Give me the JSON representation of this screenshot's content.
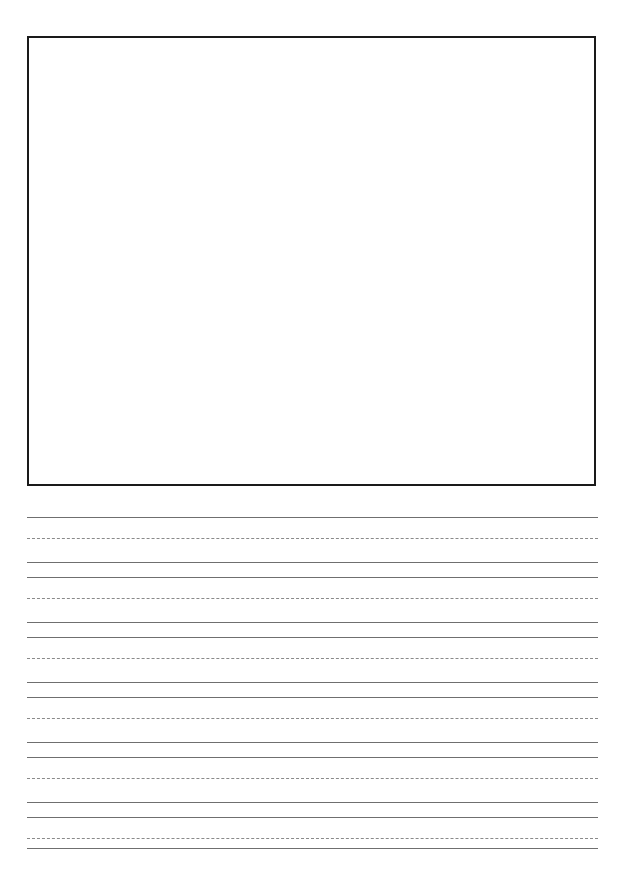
{
  "page": {
    "kind": "handwriting-practice-worksheet",
    "width": 627,
    "height": 876,
    "background_color": "#ffffff",
    "title": "",
    "name_label": "",
    "date_label": ""
  },
  "drawing_box": {
    "name": "illustration-box",
    "label": "",
    "content": "",
    "x": 27,
    "y": 36,
    "width": 569,
    "height": 450,
    "border_color": "#1a1a1a",
    "border_width": 2,
    "fill_color": "#ffffff"
  },
  "writing_area": {
    "left": 27,
    "right": 598,
    "line_length": 571,
    "solid_color": "#6f6f6f",
    "dashed_color": "#8a8a8a",
    "solid_width": 1,
    "dashed_width": 1,
    "dash_pattern": "4 3",
    "row_count": 6,
    "row_pitch": 60,
    "rows": [
      {
        "index": 1,
        "top": 517,
        "mid": 538,
        "base": 562,
        "text": ""
      },
      {
        "index": 2,
        "top": 577,
        "mid": 598,
        "base": 622,
        "text": ""
      },
      {
        "index": 3,
        "top": 637,
        "mid": 658,
        "base": 682,
        "text": ""
      },
      {
        "index": 4,
        "top": 697,
        "mid": 718,
        "base": 742,
        "text": ""
      },
      {
        "index": 5,
        "top": 757,
        "mid": 778,
        "base": 802,
        "text": ""
      },
      {
        "index": 6,
        "top": 817,
        "mid": 838,
        "base": 848,
        "text": ""
      }
    ]
  }
}
